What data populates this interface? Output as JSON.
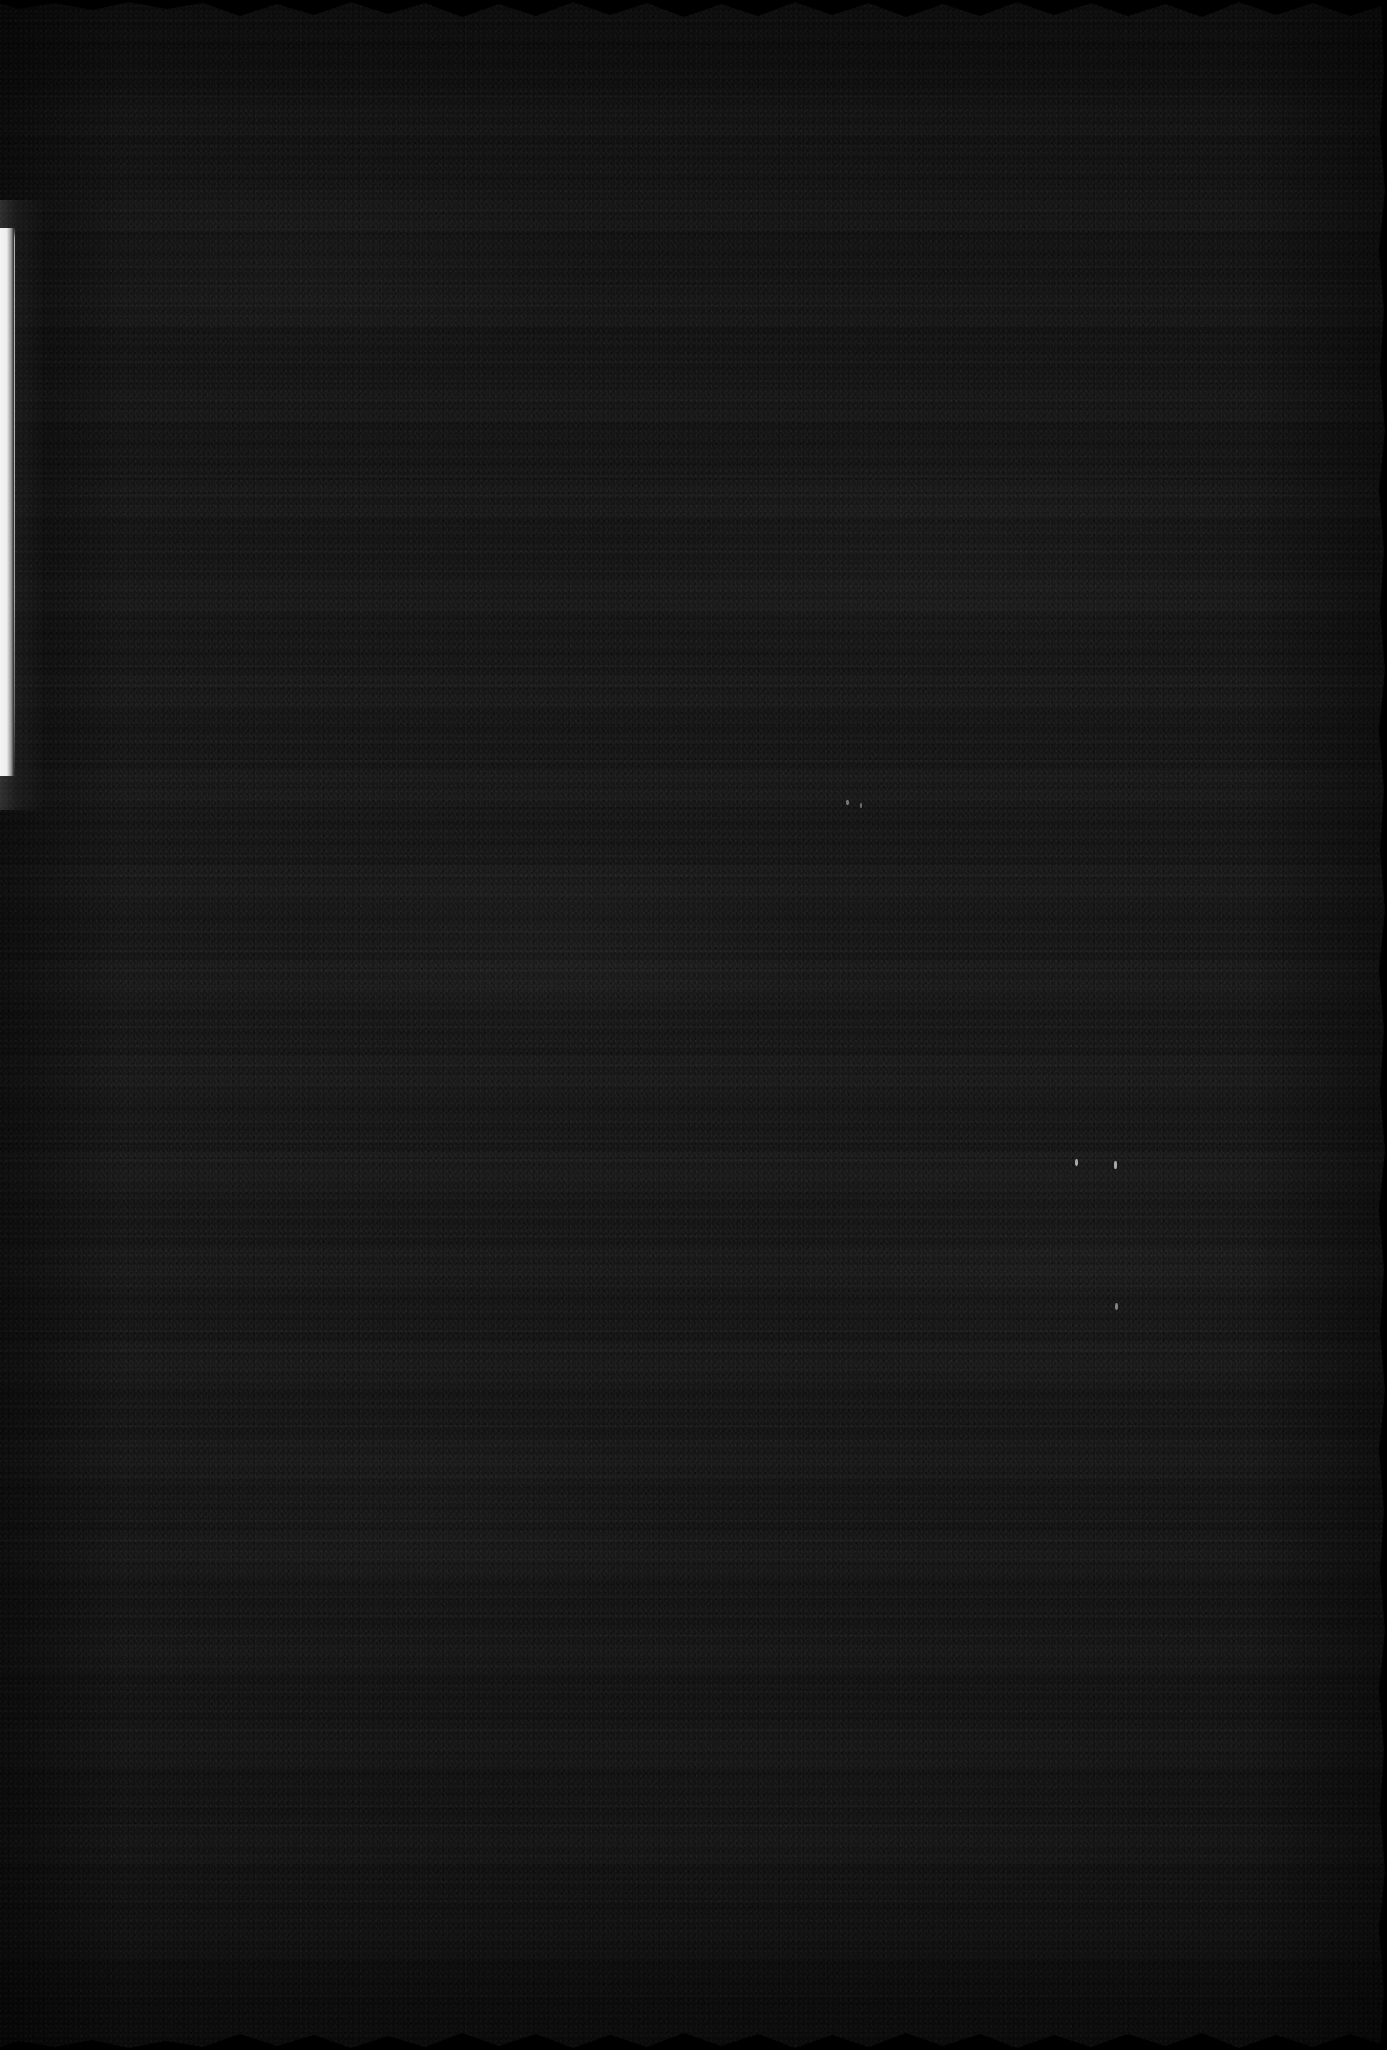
{
  "image": {
    "kind": "scanned-document-page",
    "description": "Severely underexposed scan of a textured paper page; no legible text content is visible in the pixels.",
    "width_px": 1387,
    "height_px": 2050,
    "legible_text": "",
    "dominant_color": "#141414",
    "background_color": "#000000"
  },
  "page": {
    "surface_name": "textured-paper-surface",
    "surface_color": "#141414",
    "grain": "fine horizontal banding suggesting rows of unreadable text",
    "edge_style": "deckled / scalloped top and bottom edges"
  },
  "artifacts": {
    "light_leak": {
      "name": "left-edge-light-leak",
      "color": "#f0f0f0",
      "x_px": 0,
      "y_px": 228,
      "width_px": 15,
      "height_px": 548
    },
    "specks": [
      {
        "x_px": 1075,
        "y_px": 1159,
        "width_px": 3,
        "height_px": 7
      },
      {
        "x_px": 1114,
        "y_px": 1161,
        "width_px": 3,
        "height_px": 8
      },
      {
        "x_px": 1115,
        "y_px": 1303,
        "width_px": 3,
        "height_px": 7
      },
      {
        "x_px": 846,
        "y_px": 800,
        "width_px": 3,
        "height_px": 5
      },
      {
        "x_px": 860,
        "y_px": 803,
        "width_px": 2,
        "height_px": 5
      }
    ]
  },
  "deckle": {
    "top_label": "top-deckled-edge",
    "bottom_label": "bottom-deckled-edge",
    "right_label": "right-wavy-edge",
    "tooth_count": 22,
    "tooth_depth_px": 16
  }
}
